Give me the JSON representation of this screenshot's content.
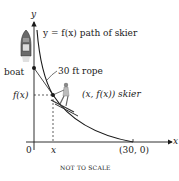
{
  "diagram": {
    "axes": {
      "y_label": "y",
      "x_label": "x",
      "origin_label": "0"
    },
    "labels": {
      "path": "y = f(x) path of skier",
      "boat": "boat",
      "rope": "30 ft rope",
      "fx_tick": "f(x)",
      "x_tick": "x",
      "skier_point": "(x, f(x)) skier",
      "endpoint": "(30, 0)",
      "note": "NOT TO SCALE"
    },
    "colors": {
      "ink": "#1a1a1a",
      "boat": "#555555",
      "skier": "#777777"
    },
    "rope_length_ft": 30,
    "endpoint": [
      30,
      0
    ]
  }
}
